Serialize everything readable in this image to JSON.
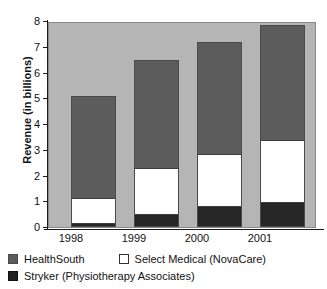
{
  "chart_data": {
    "type": "bar",
    "stacked": true,
    "title": "",
    "xlabel": "",
    "ylabel": "Revenue (in billions)",
    "categories": [
      "1998",
      "1999",
      "2000",
      "2001"
    ],
    "ylim": [
      0,
      8
    ],
    "yticks": [
      "8",
      "7",
      "6",
      "5",
      "4",
      "3",
      "2",
      "1",
      "0"
    ],
    "ytick_values": [
      8,
      7,
      6,
      5,
      4,
      3,
      2,
      1,
      0
    ],
    "grid": false,
    "legend_position": "bottom-left",
    "series": [
      {
        "name": "Stryker (Physiotherapy Associates)",
        "color": "#262626",
        "values": [
          0.1,
          0.45,
          0.78,
          0.95
        ]
      },
      {
        "name": "Select Medical (NovaCare)",
        "color": "#ffffff",
        "values": [
          1.0,
          1.8,
          2.02,
          2.4
        ]
      },
      {
        "name": "HealthSouth",
        "color": "#5c5c5c",
        "values": [
          3.9,
          4.15,
          4.3,
          4.4
        ]
      }
    ],
    "totals": [
      5.0,
      6.4,
      7.1,
      7.75
    ],
    "segment_tops": {
      "1998": {
        "stryker": 0.1,
        "select": 1.1,
        "total": 5.0
      },
      "1999": {
        "stryker": 0.45,
        "select": 2.25,
        "total": 6.4
      },
      "2000": {
        "stryker": 0.78,
        "select": 2.8,
        "total": 7.1
      },
      "2001": {
        "stryker": 0.95,
        "select": 3.35,
        "total": 7.75
      }
    },
    "colors": {
      "plot_background": "#b5b5b5",
      "healthsouth": "#5c5c5c",
      "select_medical": "#ffffff",
      "stryker": "#262626",
      "axis": "#1a1a1a",
      "page_background": "#ffffff"
    }
  },
  "legend": {
    "rows": [
      [
        {
          "key": "healthsouth",
          "label": "HealthSouth",
          "swatch": "#5c5c5c"
        },
        {
          "key": "select",
          "label": "Select Medical (NovaCare)",
          "swatch": "#ffffff"
        }
      ],
      [
        {
          "key": "stryker",
          "label": "Stryker (Physiotherapy Associates)",
          "swatch": "#262626"
        }
      ]
    ],
    "healthsouth_label": "HealthSouth",
    "select_label": "Select Medical (NovaCare)",
    "stryker_label": "Stryker (Physiotherapy Associates)"
  },
  "axis": {
    "ylabel": "Revenue (in billions)",
    "ytick_0": "0",
    "ytick_1": "1",
    "ytick_2": "2",
    "ytick_3": "3",
    "ytick_4": "4",
    "ytick_5": "5",
    "ytick_6": "6",
    "ytick_7": "7",
    "ytick_8": "8",
    "xtick_0": "1998",
    "xtick_1": "1999",
    "xtick_2": "2000",
    "xtick_3": "2001"
  }
}
